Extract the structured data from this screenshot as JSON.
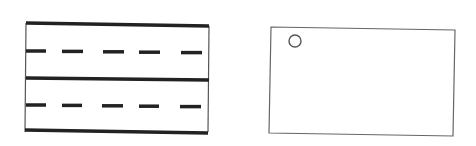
{
  "diagrams": [
    {
      "name": "road-lanes",
      "description": "Two-lane road strip with solid boundary lines and dashed center lines",
      "frame": {
        "x1": 26,
        "y1": 23,
        "x2": 209,
        "y2": 132
      },
      "solid_lines": [
        {
          "x1": 26,
          "y1": 23,
          "x2": 209,
          "y2": 26
        },
        {
          "x1": 26,
          "y1": 78,
          "x2": 209,
          "y2": 80
        },
        {
          "x1": 25,
          "y1": 130,
          "x2": 208,
          "y2": 133
        }
      ],
      "dashed_rows": [
        {
          "y": 51,
          "dashes": [
            [
              26,
              46
            ],
            [
              62,
              83
            ],
            [
              103,
              124
            ],
            [
              139,
              160
            ],
            [
              181,
              202
            ]
          ]
        },
        {
          "y": 105,
          "dashes": [
            [
              26,
              46
            ],
            [
              62,
              82
            ],
            [
              102,
              123
            ],
            [
              139,
              159
            ],
            [
              180,
              201
            ]
          ]
        }
      ],
      "line_color": "#222222",
      "thin_color": "#555555"
    },
    {
      "name": "card-with-hole",
      "description": "Rectangle with a small circle near the top-left corner",
      "rect": {
        "points": "271,27 455,30 453,136 269,133"
      },
      "circle": {
        "cx": 295,
        "cy": 41,
        "r": 6
      },
      "stroke_color": "#666666"
    }
  ]
}
